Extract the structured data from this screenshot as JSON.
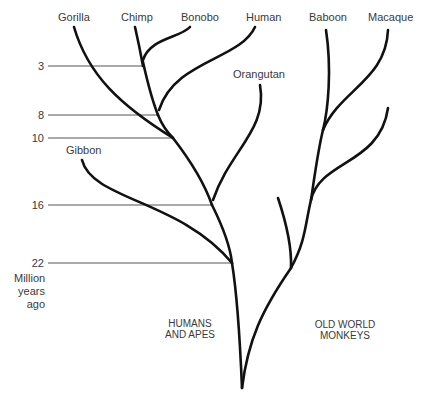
{
  "diagram": {
    "type": "phylogenetic-tree",
    "species": {
      "gorilla": "Gorilla",
      "chimp": "Chimp",
      "bonobo": "Bonobo",
      "human": "Human",
      "orangutan": "Orangutan",
      "gibbon": "Gibbon",
      "baboon": "Baboon",
      "macaque": "Macaque"
    },
    "time_axis": {
      "ticks": [
        "3",
        "8",
        "10",
        "16",
        "22"
      ],
      "unit_line1": "Million",
      "unit_line2": "years",
      "unit_line3": "ago"
    },
    "groups": {
      "humans_apes_line1": "HUMANS",
      "humans_apes_line2": "AND APES",
      "old_world_line1": "OLD WORLD",
      "old_world_line2": "MONKEYS"
    },
    "divergences": [
      {
        "pair": "Chimp–Bonobo",
        "mya": 3
      },
      {
        "pair": "Human–Chimp/Bonobo",
        "mya": 8
      },
      {
        "pair": "Gorilla–Human/Chimp",
        "mya": 10
      },
      {
        "pair": "Orangutan–African apes",
        "mya": 16
      },
      {
        "pair": "Gibbon–Great apes",
        "mya": 22
      }
    ],
    "colors": {
      "branch": "#111111",
      "guide": "#555555",
      "text": "#3a3a3a"
    }
  }
}
